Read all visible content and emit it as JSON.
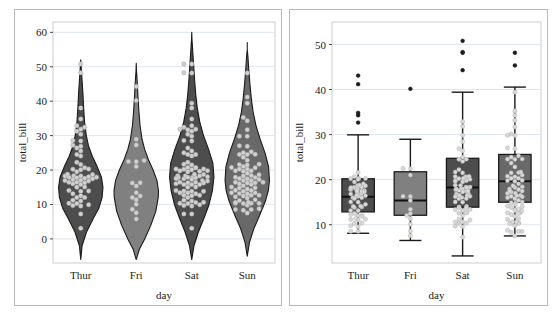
{
  "figure": {
    "background": "#ffffff",
    "frame_color": "#b9b9b9",
    "panels": [
      {
        "name": "violin-swarm-panel",
        "chart_ref": 0
      },
      {
        "name": "box-swarm-panel",
        "chart_ref": 1
      }
    ]
  },
  "chart_data": [
    {
      "type": "violin",
      "title": "",
      "xlabel": "day",
      "ylabel": "total_bill",
      "categories": [
        "Thur",
        "Fri",
        "Sat",
        "Sun"
      ],
      "xticklabels": [
        "Thur",
        "Fri",
        "Sat",
        "Sun"
      ],
      "yticks": [
        0,
        10,
        20,
        30,
        40,
        50,
        60
      ],
      "yticklabels": [
        "0",
        "10",
        "20",
        "30",
        "40",
        "50",
        "60"
      ],
      "ylim": [
        -7,
        63
      ],
      "grid": "horizontal",
      "overlay": "swarm",
      "legend": "none",
      "fills": [
        "#4d4d4d",
        "#808080",
        "#4d4d4d",
        "#696969"
      ],
      "point_color": "#d0d0d0",
      "edge_color": "#1a1a1a",
      "violins": [
        {
          "category": "Thur",
          "fill": "#4d4d4d",
          "min": 0.0,
          "max": 50.0,
          "median": 16.2,
          "q1": 12.4,
          "q3": 20.2,
          "kde_peak_value": 15.5,
          "n": 62,
          "kde": [
            {
              "v": -6,
              "w": 0.0
            },
            {
              "v": -2,
              "w": 0.06
            },
            {
              "v": 2,
              "w": 0.26
            },
            {
              "v": 6,
              "w": 0.57
            },
            {
              "v": 9,
              "w": 0.82
            },
            {
              "v": 12,
              "w": 0.96
            },
            {
              "v": 15,
              "w": 1.0
            },
            {
              "v": 18,
              "w": 0.93
            },
            {
              "v": 21,
              "w": 0.74
            },
            {
              "v": 24,
              "w": 0.52
            },
            {
              "v": 27,
              "w": 0.35
            },
            {
              "v": 30,
              "w": 0.25
            },
            {
              "v": 34,
              "w": 0.17
            },
            {
              "v": 38,
              "w": 0.13
            },
            {
              "v": 42,
              "w": 0.1
            },
            {
              "v": 46,
              "w": 0.06
            },
            {
              "v": 50,
              "w": 0.02
            },
            {
              "v": 52,
              "w": 0.0
            }
          ],
          "points": [
            27.2,
            26.88,
            12.03,
            17.07,
            16.49,
            21.58,
            9.55,
            18.35,
            15.06,
            20.69,
            17.78,
            24.06,
            16.31,
            16.93,
            18.69,
            31.27,
            16.04,
            17.46,
            13.94,
            9.68,
            30.4,
            18.29,
            22.23,
            32.4,
            28.55,
            18.04,
            12.54,
            10.29,
            34.81,
            9.94,
            25.56,
            19.49,
            38.01,
            26.41,
            11.24,
            48.27,
            20.29,
            13.81,
            11.02,
            18.29,
            17.59,
            20.08,
            16.45,
            3.07,
            20.23,
            15.01,
            12.02,
            17.92,
            50.81,
            15.81,
            7.25,
            31.85,
            16.82,
            32.9,
            17.89,
            28.44,
            18.78,
            10.33,
            14.07,
            13.13,
            17.26,
            24.55
          ]
        },
        {
          "category": "Fri",
          "fill": "#808080",
          "min": -4.0,
          "max": 49.5,
          "median": 15.38,
          "q1": 12.1,
          "q3": 21.75,
          "kde_peak_value": 14.0,
          "n": 19,
          "kde": [
            {
              "v": -6,
              "w": 0.0
            },
            {
              "v": -3,
              "w": 0.14
            },
            {
              "v": 0,
              "w": 0.38
            },
            {
              "v": 4,
              "w": 0.66
            },
            {
              "v": 8,
              "w": 0.88
            },
            {
              "v": 12,
              "w": 0.99
            },
            {
              "v": 14,
              "w": 1.0
            },
            {
              "v": 17,
              "w": 0.93
            },
            {
              "v": 20,
              "w": 0.76
            },
            {
              "v": 23,
              "w": 0.55
            },
            {
              "v": 26,
              "w": 0.38
            },
            {
              "v": 29,
              "w": 0.26
            },
            {
              "v": 33,
              "w": 0.17
            },
            {
              "v": 37,
              "w": 0.12
            },
            {
              "v": 41,
              "w": 0.08
            },
            {
              "v": 45,
              "w": 0.05
            },
            {
              "v": 49,
              "w": 0.01
            },
            {
              "v": 51,
              "w": 0.0
            }
          ],
          "points": [
            28.97,
            22.49,
            5.75,
            16.32,
            22.75,
            40.17,
            27.28,
            12.03,
            21.01,
            12.46,
            11.35,
            15.38,
            44.3,
            22.42,
            13.42,
            16.27,
            10.09,
            7.56,
            8.58
          ]
        },
        {
          "category": "Sat",
          "fill": "#4d4d4d",
          "min": -5.0,
          "max": 58.5,
          "median": 18.24,
          "q1": 13.9,
          "q3": 24.74,
          "kde_peak_value": 18.0,
          "n": 87,
          "kde": [
            {
              "v": -6,
              "w": 0.0
            },
            {
              "v": -2,
              "w": 0.1
            },
            {
              "v": 2,
              "w": 0.3
            },
            {
              "v": 6,
              "w": 0.55
            },
            {
              "v": 10,
              "w": 0.78
            },
            {
              "v": 14,
              "w": 0.93
            },
            {
              "v": 18,
              "w": 1.0
            },
            {
              "v": 22,
              "w": 0.95
            },
            {
              "v": 26,
              "w": 0.76
            },
            {
              "v": 30,
              "w": 0.53
            },
            {
              "v": 34,
              "w": 0.36
            },
            {
              "v": 38,
              "w": 0.25
            },
            {
              "v": 42,
              "w": 0.18
            },
            {
              "v": 46,
              "w": 0.13
            },
            {
              "v": 50,
              "w": 0.09
            },
            {
              "v": 54,
              "w": 0.05
            },
            {
              "v": 58,
              "w": 0.01
            },
            {
              "v": 60,
              "w": 0.0
            }
          ],
          "points": [
            20.65,
            17.92,
            20.29,
            15.77,
            39.42,
            19.82,
            17.81,
            13.37,
            12.69,
            21.7,
            19.65,
            9.55,
            18.35,
            15.06,
            20.69,
            17.78,
            24.06,
            16.31,
            16.93,
            18.69,
            31.27,
            16.04,
            17.46,
            13.94,
            9.68,
            30.4,
            18.29,
            22.23,
            32.4,
            28.55,
            18.04,
            12.54,
            10.29,
            34.81,
            9.94,
            25.56,
            19.49,
            38.01,
            26.41,
            11.24,
            48.27,
            20.29,
            13.81,
            11.02,
            18.29,
            17.59,
            20.08,
            16.45,
            3.07,
            20.23,
            15.01,
            12.02,
            17.92,
            50.81,
            15.81,
            7.25,
            31.85,
            16.82,
            32.9,
            17.89,
            28.44,
            18.78,
            10.33,
            14.07,
            13.13,
            17.26,
            24.55,
            19.77,
            29.85,
            48.17,
            25.0,
            13.39,
            16.49,
            21.5,
            12.66,
            16.21,
            13.81,
            17.51,
            24.52,
            20.76,
            31.71,
            10.59,
            10.63,
            50.81,
            15.81,
            7.25,
            31.85
          ]
        },
        {
          "category": "Sun",
          "fill": "#696969",
          "min": 0.0,
          "max": 55.5,
          "median": 19.63,
          "q1": 14.99,
          "q3": 25.6,
          "kde_peak_value": 17.5,
          "n": 76,
          "kde": [
            {
              "v": -5,
              "w": 0.0
            },
            {
              "v": -1,
              "w": 0.1
            },
            {
              "v": 3,
              "w": 0.3
            },
            {
              "v": 7,
              "w": 0.57
            },
            {
              "v": 11,
              "w": 0.82
            },
            {
              "v": 14,
              "w": 0.95
            },
            {
              "v": 17,
              "w": 1.0
            },
            {
              "v": 21,
              "w": 0.96
            },
            {
              "v": 25,
              "w": 0.8
            },
            {
              "v": 29,
              "w": 0.58
            },
            {
              "v": 33,
              "w": 0.39
            },
            {
              "v": 37,
              "w": 0.26
            },
            {
              "v": 41,
              "w": 0.18
            },
            {
              "v": 45,
              "w": 0.12
            },
            {
              "v": 49,
              "w": 0.07
            },
            {
              "v": 53,
              "w": 0.03
            },
            {
              "v": 55,
              "w": 0.0
            },
            {
              "v": 57,
              "w": 0.0
            }
          ],
          "points": [
            16.99,
            10.34,
            21.01,
            23.68,
            24.59,
            25.29,
            8.77,
            26.88,
            15.04,
            14.78,
            10.27,
            35.26,
            15.42,
            18.43,
            14.83,
            21.58,
            10.33,
            16.29,
            16.97,
            20.65,
            17.92,
            20.29,
            15.77,
            39.42,
            19.82,
            17.81,
            13.37,
            12.69,
            21.7,
            19.65,
            12.48,
            29.8,
            8.52,
            14.52,
            11.38,
            22.82,
            19.08,
            20.27,
            11.17,
            12.26,
            18.26,
            8.51,
            10.33,
            14.15,
            16.0,
            13.16,
            17.47,
            34.3,
            41.19,
            27.05,
            16.43,
            8.35,
            18.64,
            11.87,
            9.78,
            7.51,
            14.07,
            13.13,
            17.26,
            24.55,
            19.77,
            29.85,
            48.17,
            25.0,
            13.39,
            16.49,
            21.5,
            12.66,
            16.21,
            13.81,
            17.51,
            24.52,
            20.76,
            31.71,
            10.59,
            10.63
          ]
        }
      ]
    },
    {
      "type": "box",
      "title": "",
      "xlabel": "day",
      "ylabel": "total_bill",
      "categories": [
        "Thur",
        "Fri",
        "Sat",
        "Sun"
      ],
      "xticklabels": [
        "Thur",
        "Fri",
        "Sat",
        "Sun"
      ],
      "yticks": [
        10,
        20,
        30,
        40,
        50
      ],
      "yticklabels": [
        "10",
        "20",
        "30",
        "40",
        "50"
      ],
      "ylim": [
        1.5,
        55
      ],
      "grid": "horizontal",
      "overlay": "swarm",
      "legend": "none",
      "fills": [
        "#4d4d4d",
        "#808080",
        "#4d4d4d",
        "#696969"
      ],
      "point_color": "#d8d8d8",
      "edge_color": "#1a1a1a",
      "boxes": [
        {
          "category": "Thur",
          "fill": "#4d4d4d",
          "q1": 12.85,
          "median": 16.2,
          "q3": 20.2,
          "whisker_low": 8.1,
          "whisker_high": 29.95,
          "outliers": [
            43.11,
            41.19,
            34.83,
            34.3,
            32.68
          ],
          "swarm": [
            12.03,
            17.07,
            16.49,
            21.58,
            9.55,
            18.35,
            15.06,
            20.69,
            17.78,
            16.31,
            16.93,
            18.69,
            16.04,
            17.46,
            13.94,
            18.29,
            18.04,
            12.54,
            10.29,
            19.49,
            11.24,
            20.29,
            13.81,
            11.02,
            18.29,
            17.59,
            20.08,
            16.45,
            20.23,
            15.01,
            12.02,
            17.92,
            15.81,
            16.82,
            17.89,
            18.78,
            10.33,
            14.07,
            13.13,
            17.26,
            8.52,
            14.52,
            11.38,
            19.08,
            20.27,
            11.17,
            12.26,
            18.26,
            8.51,
            14.15,
            16.0,
            13.16,
            17.47,
            16.43,
            18.64,
            11.87,
            9.78
          ]
        },
        {
          "category": "Fri",
          "fill": "#808080",
          "q1": 12.1,
          "median": 15.38,
          "q3": 21.75,
          "whisker_low": 6.5,
          "whisker_high": 28.97,
          "outliers": [
            40.17
          ],
          "swarm": [
            22.49,
            16.32,
            12.03,
            21.01,
            12.46,
            11.35,
            15.38,
            22.42,
            13.42,
            16.27,
            10.09,
            7.56,
            8.58
          ]
        },
        {
          "category": "Sat",
          "fill": "#4d4d4d",
          "q1": 13.9,
          "median": 18.24,
          "q3": 24.74,
          "whisker_low": 3.07,
          "whisker_high": 39.42,
          "outliers": [
            50.81,
            48.33,
            48.17,
            44.3
          ],
          "swarm": [
            20.65,
            17.92,
            20.29,
            15.77,
            19.82,
            17.81,
            13.37,
            12.69,
            21.7,
            19.65,
            9.55,
            18.35,
            15.06,
            20.69,
            17.78,
            24.06,
            16.31,
            16.93,
            18.69,
            16.04,
            17.46,
            13.94,
            9.68,
            18.29,
            22.23,
            18.04,
            12.54,
            10.29,
            19.49,
            26.41,
            11.24,
            20.29,
            13.81,
            11.02,
            18.29,
            17.59,
            20.08,
            16.45,
            20.23,
            15.01,
            12.02,
            17.92,
            15.81,
            16.82,
            17.89,
            28.44,
            18.78,
            10.33,
            14.07,
            13.13,
            17.26,
            24.55,
            19.77,
            29.85,
            25.0,
            13.39,
            16.49,
            21.5,
            12.66,
            16.21,
            13.81,
            17.51,
            24.52,
            20.76,
            10.59,
            10.63,
            7.25,
            31.85,
            32.9,
            26.88
          ]
        },
        {
          "category": "Sun",
          "fill": "#696969",
          "q1": 14.99,
          "median": 19.63,
          "q3": 25.6,
          "whisker_low": 7.51,
          "whisker_high": 40.55,
          "outliers": [
            48.17,
            45.35
          ],
          "swarm": [
            16.99,
            10.34,
            21.01,
            23.68,
            24.59,
            25.29,
            8.77,
            26.88,
            15.04,
            14.78,
            10.27,
            15.42,
            18.43,
            14.83,
            21.58,
            10.33,
            16.29,
            16.97,
            20.65,
            17.92,
            20.29,
            15.77,
            19.82,
            17.81,
            13.37,
            12.69,
            21.7,
            19.65,
            12.48,
            29.8,
            8.52,
            14.52,
            11.38,
            22.82,
            19.08,
            20.27,
            11.17,
            12.26,
            18.26,
            8.51,
            10.33,
            14.15,
            16.0,
            13.16,
            17.47,
            34.3,
            27.05,
            16.43,
            8.35,
            18.64,
            11.87,
            9.78,
            7.51,
            14.07,
            13.13,
            17.26,
            24.55,
            19.77,
            29.85,
            25.0,
            13.39,
            16.49,
            21.5,
            12.66,
            16.21,
            13.81,
            17.51,
            24.52,
            20.76,
            31.71,
            10.59,
            10.63,
            35.26,
            39.42,
            33.16,
            30.14
          ]
        }
      ]
    }
  ]
}
